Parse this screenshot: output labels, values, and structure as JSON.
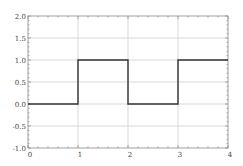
{
  "chart_data": {
    "type": "line",
    "title": "",
    "xlabel": "",
    "ylabel": "",
    "xlim": [
      0,
      4
    ],
    "ylim": [
      -1.0,
      2.0
    ],
    "grid": true,
    "legend": null,
    "x_ticks": [
      0,
      1,
      2,
      3,
      4
    ],
    "x_tick_labels": [
      "0",
      "1",
      "2",
      "3",
      "4"
    ],
    "y_ticks": [
      -1.0,
      -0.5,
      0.0,
      0.5,
      1.0,
      1.5,
      2.0
    ],
    "y_tick_labels": [
      "-1.0",
      "-0.5",
      "0.0",
      "0.5",
      "1.0",
      "1.5",
      "2.0"
    ],
    "series": [
      {
        "name": "square wave",
        "step": true,
        "color": "#333333",
        "x": [
          0,
          1,
          1,
          2,
          2,
          3,
          3,
          4
        ],
        "y": [
          0,
          0,
          1,
          1,
          0,
          0,
          1,
          1
        ]
      }
    ]
  },
  "colors": {
    "line": "#333333",
    "grid": "#d9d9d9",
    "axis": "#888888",
    "background": "#ffffff"
  }
}
